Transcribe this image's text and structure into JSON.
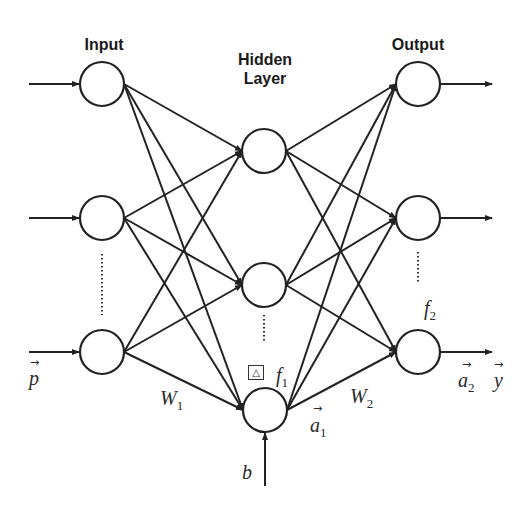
{
  "layers": {
    "input": {
      "title": "Input",
      "node_count_shown": 3,
      "ellipsis": true
    },
    "hidden": {
      "title_line1": "Hidden",
      "title_line2": "Layer",
      "node_count_shown": 3,
      "ellipsis": true
    },
    "output": {
      "title": "Output",
      "node_count_shown": 3,
      "ellipsis": true
    }
  },
  "labels": {
    "input_vector": "p",
    "input_vector_arrow": "→",
    "weights_1": "W",
    "weights_1_sub": "1",
    "weights_2": "W",
    "weights_2_sub": "2",
    "bias": "b",
    "hidden_activation": "a",
    "hidden_activation_sub": "1",
    "hidden_activation_arrow": "→",
    "hidden_transfer_fn": "f",
    "hidden_transfer_fn_sub": "1",
    "hidden_transfer_icon": "△",
    "output_transfer_fn": "f",
    "output_transfer_fn_sub": "2",
    "output_activation": "a",
    "output_activation_sub": "2",
    "output_activation_arrow": "→",
    "output_vector": "y",
    "output_vector_arrow": "→"
  },
  "colors": {
    "stroke": "#222222",
    "background": "#ffffff"
  }
}
